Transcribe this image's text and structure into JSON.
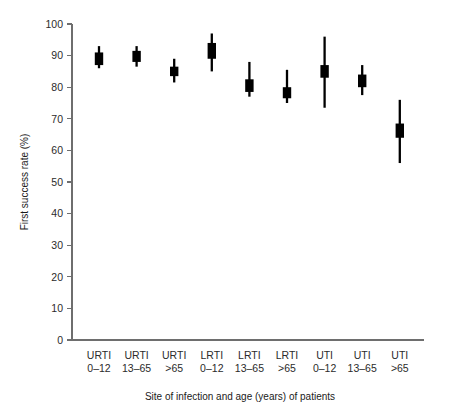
{
  "chart_data": {
    "type": "scatter",
    "title": "",
    "xlabel": "Site of infection and age (years) of patients",
    "ylabel": "First success rate (%)",
    "ylim": [
      0,
      100
    ],
    "ytick_step": 10,
    "grid": false,
    "legend": "none",
    "yticks": [
      "0",
      "10",
      "20",
      "30",
      "40",
      "50",
      "60",
      "70",
      "80",
      "90",
      "100"
    ],
    "categories": [
      {
        "site": "URTI",
        "age": "0–12"
      },
      {
        "site": "URTI",
        "age": "13–65"
      },
      {
        "site": "URTI",
        "age": ">65"
      },
      {
        "site": "LRTI",
        "age": "0–12"
      },
      {
        "site": "LRTI",
        "age": "13–65"
      },
      {
        "site": "LRTI",
        "age": ">65"
      },
      {
        "site": "UTI",
        "age": "0–12"
      },
      {
        "site": "UTI",
        "age": "13–65"
      },
      {
        "site": "UTI",
        "age": ">65"
      }
    ],
    "series": [
      {
        "name": "First success rate with 95% CI",
        "marker": "filled-square-with-error-bar",
        "color": "#000000",
        "points": [
          {
            "label": "URTI 0–12",
            "estimate": 89.0,
            "ci_low": 86.0,
            "ci_high": 93.0,
            "box_low": 87.0,
            "box_high": 91.0
          },
          {
            "label": "URTI 13–65",
            "estimate": 89.5,
            "ci_low": 86.5,
            "ci_high": 93.0,
            "box_low": 88.0,
            "box_high": 91.5
          },
          {
            "label": "URTI >65",
            "estimate": 85.0,
            "ci_low": 81.5,
            "ci_high": 89.0,
            "box_low": 83.5,
            "box_high": 86.5
          },
          {
            "label": "LRTI 0–12",
            "estimate": 91.5,
            "ci_low": 85.0,
            "ci_high": 97.0,
            "box_low": 89.0,
            "box_high": 94.0
          },
          {
            "label": "LRTI 13–65",
            "estimate": 80.5,
            "ci_low": 77.0,
            "ci_high": 88.0,
            "box_low": 78.5,
            "box_high": 82.5
          },
          {
            "label": "LRTI >65",
            "estimate": 78.0,
            "ci_low": 75.0,
            "ci_high": 85.5,
            "box_low": 76.5,
            "box_high": 80.0
          },
          {
            "label": "UTI 0–12",
            "estimate": 85.0,
            "ci_low": 73.5,
            "ci_high": 96.0,
            "box_low": 83.0,
            "box_high": 87.0
          },
          {
            "label": "UTI 13–65",
            "estimate": 82.0,
            "ci_low": 77.5,
            "ci_high": 87.0,
            "box_low": 80.0,
            "box_high": 84.0
          },
          {
            "label": "UTI >65",
            "estimate": 66.0,
            "ci_low": 56.0,
            "ci_high": 76.0,
            "box_low": 64.0,
            "box_high": 68.5
          }
        ]
      }
    ]
  }
}
